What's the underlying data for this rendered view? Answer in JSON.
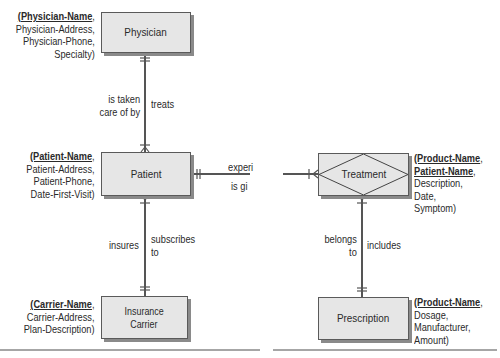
{
  "entities": {
    "physician": {
      "label": "Physician",
      "attr_key": "(Physician-Name",
      "attr_key_suffix": ",",
      "attrs": [
        "Physician-Address,",
        "Physician-Phone,",
        "Specialty)"
      ]
    },
    "patient": {
      "label": "Patient",
      "attr_key": "(Patient-Name",
      "attr_key_suffix": ",",
      "attrs": [
        "Patient-Address,",
        "Patient-Phone,",
        "Date-First-Visit)"
      ]
    },
    "insurance_carrier": {
      "label_line1": "Insurance",
      "label_line2": "Carrier",
      "attr_key": "(Carrier-Name",
      "attr_key_suffix": ",",
      "attrs": [
        "Carrier-Address,",
        "Plan-Description)"
      ]
    },
    "treatment": {
      "label": "Treatment",
      "attr_key": "(Product-Name",
      "attr_key_suffix": ",",
      "attr_key2": "Patient-Name",
      "attr_key2_suffix": ",",
      "attrs": [
        "Description,",
        "Date,",
        "Symptom)"
      ]
    },
    "prescription": {
      "label": "Prescription",
      "attr_key": "(Product-Name",
      "attr_key_suffix": ",",
      "attrs": [
        "Dosage,",
        "Manufacturer,",
        "Amount)"
      ]
    }
  },
  "relationships": {
    "physician_patient": {
      "left_line1": "is taken",
      "left_line2": "care of by",
      "right": "treats"
    },
    "patient_carrier": {
      "left": "insures",
      "right_line1": "subscribes",
      "right_line2": "to"
    },
    "patient_treatment": {
      "top": "experi",
      "bottom": "is gi"
    },
    "treatment_prescription": {
      "left_line1": "belongs",
      "left_line2": "to",
      "right": "includes"
    }
  }
}
